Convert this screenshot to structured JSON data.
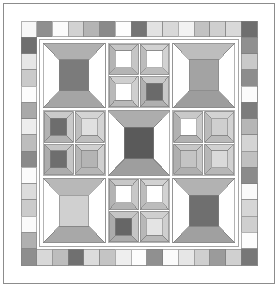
{
  "canvas": {
    "width": 278,
    "height": 287,
    "background": "#ffffff"
  },
  "artwork": {
    "title": "Quilt Block Pattern",
    "type": "patchwork-quilt-diagram",
    "description": "Symmetric nine-patch quilt layout with checkerboard piano-key border, corner square-in-square blocks, and a central square-in-square medallion."
  },
  "palette": {
    "outline": "#808080",
    "seam_line": "#9a9a9a",
    "white": "#ffffff",
    "off_white": "#f4f4f4",
    "very_light": "#e9e9e9",
    "light": "#dddddd",
    "light_mid": "#cccccc",
    "mid": "#b8b8b8",
    "mid_gray": "#a8a8a8",
    "gray": "#9a9a9a",
    "dark_gray": "#8a8a8a",
    "dark": "#707070",
    "darker": "#606060",
    "darkest": "#555555",
    "charcoal": "#4d4d4d"
  },
  "frame": {
    "outer_border_color": "#808080",
    "outer_border_width": 1,
    "inner_margin_color": "#ffffff",
    "sashing_color": "#ffffff"
  },
  "border": {
    "name": "piano-key-checkerboard",
    "cell_size": 15.6,
    "top_cells": [
      "#f7f7f7",
      "#8f8f8f",
      "#fbfbfb",
      "#d2d2d2",
      "#b4b4b4",
      "#8a8a8a",
      "#fdfdfd",
      "#747474",
      "#e2e2e2",
      "#d8d8d8",
      "#f2f2f2",
      "#c2c2c2",
      "#cfcfcf",
      "#d9d9d9",
      "#6e6e6e"
    ],
    "right_cells": [
      "#6e6e6e",
      "#909090",
      "#c9c9c9",
      "#8d8d8d",
      "#fbfbfb",
      "#7c7c7c",
      "#b6b6b6",
      "#d4d4d4",
      "#c0c0c0",
      "#8b8b8b",
      "#fafafa",
      "#d6d6d6",
      "#cfcfcf",
      "#fcfcfc",
      "#777777"
    ],
    "bottom_cells": [
      "#8e8e8e",
      "#d8d8d8",
      "#bdbdbd",
      "#707070",
      "#dcdcdc",
      "#c4c4c4",
      "#eeeeee",
      "#fdfdfd",
      "#909090",
      "#fbfbfb",
      "#e6e6e6",
      "#cfcfcf",
      "#9b9b9b",
      "#d0d0d0",
      "#6f6f6f"
    ],
    "left_cells": [
      "#f7f7f7",
      "#6f6f6f",
      "#e6e6e6",
      "#cacaca",
      "#fcfcfc",
      "#a9a9a9",
      "#ededed",
      "#bdbdbd",
      "#8a8a8a",
      "#fbfbfb",
      "#dcdcdc",
      "#cbcbcb",
      "#fafafa",
      "#b0b0b0",
      "#8e8e8e"
    ]
  },
  "blocks": {
    "corner_top_left": {
      "name": "square-in-square",
      "center": "#7b7b7b",
      "top": "#b0b0b0",
      "bottom": "#a5a5a5",
      "left": "#ffffff",
      "right": "#ffffff"
    },
    "corner_top_right": {
      "name": "square-in-square",
      "center": "#a3a3a3",
      "top": "#bdbdbd",
      "bottom": "#9d9d9d",
      "left": "#ffffff",
      "right": "#ffffff"
    },
    "corner_bottom_left": {
      "name": "square-in-square",
      "center": "#d0d0d0",
      "top": "#b8b8b8",
      "bottom": "#a8a8a8",
      "left": "#ffffff",
      "right": "#ffffff"
    },
    "corner_bottom_right": {
      "name": "square-in-square",
      "center": "#6f6f6f",
      "top": "#b2b2b2",
      "bottom": "#a0a0a0",
      "left": "#ffffff",
      "right": "#ffffff"
    },
    "center_medallion": {
      "name": "square-in-square",
      "center": "#5a5a5a",
      "top": "#adadad",
      "bottom": "#9e9e9e",
      "left": "#ffffff",
      "right": "#ffffff"
    },
    "edge_top": {
      "name": "four-patch-of-square-in-square",
      "units": [
        {
          "center": "#ffffff",
          "frame_a": "#c6c6c6",
          "frame_b": "#b4b4b4"
        },
        {
          "center": "#ffffff",
          "frame_a": "#d2d2d2",
          "frame_b": "#bcbcbc"
        },
        {
          "center": "#ffffff",
          "frame_a": "#cfcfcf",
          "frame_b": "#b9b9b9"
        },
        {
          "center": "#6a6a6a",
          "frame_a": "#c8c8c8",
          "frame_b": "#b0b0b0"
        }
      ]
    },
    "edge_left": {
      "name": "four-patch-of-square-in-square",
      "units": [
        {
          "center": "#6d6d6d",
          "frame_a": "#cacaca",
          "frame_b": "#b2b2b2"
        },
        {
          "center": "#e0e0e0",
          "frame_a": "#d4d4d4",
          "frame_b": "#bebebe"
        },
        {
          "center": "#6e6e6e",
          "frame_a": "#c6c6c6",
          "frame_b": "#adadad"
        },
        {
          "center": "#b4b4b4",
          "frame_a": "#d0d0d0",
          "frame_b": "#b6b6b6"
        }
      ]
    },
    "edge_right": {
      "name": "four-patch-of-square-in-square",
      "units": [
        {
          "center": "#ffffff",
          "frame_a": "#c9c9c9",
          "frame_b": "#b1b1b1"
        },
        {
          "center": "#cfcfcf",
          "frame_a": "#d3d3d3",
          "frame_b": "#bababa"
        },
        {
          "center": "#c4c4c4",
          "frame_a": "#c7c7c7",
          "frame_b": "#afafaf"
        },
        {
          "center": "#dadada",
          "frame_a": "#d1d1d1",
          "frame_b": "#b7b7b7"
        }
      ]
    },
    "edge_bottom": {
      "name": "four-patch-of-square-in-square",
      "units": [
        {
          "center": "#ffffff",
          "frame_a": "#c8c8c8",
          "frame_b": "#b3b3b3"
        },
        {
          "center": "#ffffff",
          "frame_a": "#d2d2d2",
          "frame_b": "#bcbcbc"
        },
        {
          "center": "#666666",
          "frame_a": "#c5c5c5",
          "frame_b": "#acacac"
        },
        {
          "center": "#e4e4e4",
          "frame_a": "#cfcfcf",
          "frame_b": "#b8b8b8"
        }
      ]
    }
  },
  "chart_data": {
    "type": "table",
    "categories": [
      "corner-blocks",
      "edge-blocks",
      "center-medallion",
      "piano-key-border"
    ],
    "values": [
      4,
      4,
      1,
      56
    ],
    "xlabel": "component",
    "ylabel": "count"
  }
}
